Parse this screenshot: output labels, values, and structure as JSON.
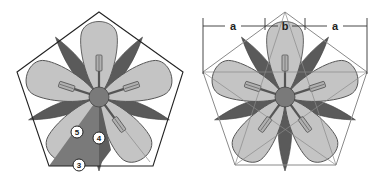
{
  "figure": {
    "left_diagram": {
      "description": "five-petal flower inscribed in pentagon with construction triangle",
      "markers": [
        "5",
        "4",
        "3"
      ]
    },
    "right_diagram": {
      "description": "five-petal flower with pentagon construction guides and dimension labels",
      "dimension_labels": [
        "a",
        "b",
        "a"
      ]
    },
    "colors": {
      "petal": "#c4c4c4",
      "dark_leaf": "#5a5a5a",
      "center": "#7a7a7a",
      "outline": "#222222",
      "guide": "#8a8a8a"
    }
  }
}
